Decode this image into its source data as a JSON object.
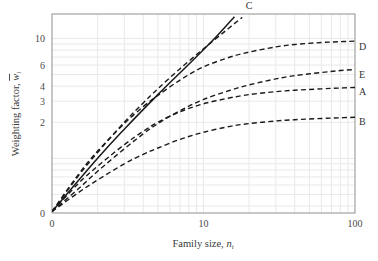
{
  "chart_data": {
    "type": "line",
    "title": "",
    "subtitle": "",
    "xlabel": "Family size, n",
    "xlabel_sub": "i",
    "ylabel": "Weighting factor, w",
    "ylabel_sub": "i",
    "ylabel_overbar": true,
    "x_scale": "log",
    "y_scale": "log",
    "xlim": [
      1,
      100
    ],
    "ylim": [
      0.35,
      16
    ],
    "x_tick_labels": [
      "0",
      "10",
      "100"
    ],
    "x_tick_values": [
      1,
      10,
      100
    ],
    "y_tick_labels": [
      "0",
      "2",
      "3",
      "4",
      "6",
      "10"
    ],
    "y_tick_values": [
      0.35,
      2,
      3,
      4,
      6,
      10
    ],
    "grid": true,
    "grid_color": "#e9e9e9",
    "legend": "inline-right-labels",
    "axis_color": "#808080",
    "line_color": "#1a1a1a",
    "series": [
      {
        "name": "A",
        "label": "A",
        "style": "dashed",
        "label_x": 100,
        "label_y": 3.35,
        "x": [
          1,
          1.5,
          2,
          3,
          4,
          5,
          7,
          10,
          15,
          20,
          30,
          40,
          60,
          80,
          100
        ],
        "y": [
          0.36,
          0.62,
          0.86,
          1.3,
          1.68,
          2.0,
          2.45,
          2.85,
          3.2,
          3.4,
          3.6,
          3.7,
          3.8,
          3.86,
          3.9
        ]
      },
      {
        "name": "B",
        "label": "B",
        "style": "dashed",
        "label_x": 100,
        "label_y": 1.88,
        "x": [
          1,
          1.5,
          2,
          3,
          4,
          5,
          7,
          10,
          15,
          20,
          30,
          40,
          60,
          80,
          100
        ],
        "y": [
          0.36,
          0.52,
          0.66,
          0.9,
          1.08,
          1.22,
          1.44,
          1.65,
          1.85,
          1.95,
          2.05,
          2.1,
          2.15,
          2.18,
          2.2
        ]
      },
      {
        "name": "C",
        "label": "C",
        "style": "dashed",
        "label_x": 19,
        "label_y": 17.5,
        "x": [
          1,
          1.5,
          2,
          3,
          4,
          5,
          7,
          10,
          14,
          18
        ],
        "y": [
          0.36,
          0.72,
          1.12,
          2.0,
          2.9,
          3.8,
          5.6,
          8.2,
          11.6,
          15.0
        ]
      },
      {
        "name": "D",
        "label": "D",
        "style": "dashed",
        "label_x": 100,
        "label_y": 8.0,
        "x": [
          1,
          1.5,
          2,
          3,
          4,
          5,
          7,
          10,
          15,
          20,
          30,
          40,
          60,
          80,
          100
        ],
        "y": [
          0.36,
          0.74,
          1.15,
          1.95,
          2.7,
          3.35,
          4.5,
          5.8,
          7.0,
          7.7,
          8.5,
          8.9,
          9.25,
          9.4,
          9.5
        ]
      },
      {
        "name": "E",
        "label": "E",
        "style": "dashed",
        "label_x": 100,
        "label_y": 4.65,
        "x": [
          1,
          1.5,
          2,
          3,
          4,
          5,
          7,
          10,
          15,
          20,
          30,
          40,
          60,
          80,
          100
        ],
        "y": [
          0.36,
          0.56,
          0.78,
          1.2,
          1.6,
          1.95,
          2.5,
          3.1,
          3.7,
          4.1,
          4.6,
          4.9,
          5.2,
          5.4,
          5.5
        ]
      },
      {
        "name": "reference",
        "label": "",
        "style": "solid",
        "label_x": null,
        "label_y": null,
        "x": [
          1,
          2,
          3,
          5,
          8,
          12,
          16
        ],
        "y": [
          0.36,
          1.0,
          1.75,
          3.4,
          6.1,
          10.2,
          15.2
        ]
      }
    ]
  },
  "axes": {
    "x_title_text": "Family size, ",
    "x_title_var": "n",
    "x_title_sub": "i",
    "y_title_text": "Weighting factor, ",
    "y_title_var": "w",
    "y_title_sub": "i"
  }
}
